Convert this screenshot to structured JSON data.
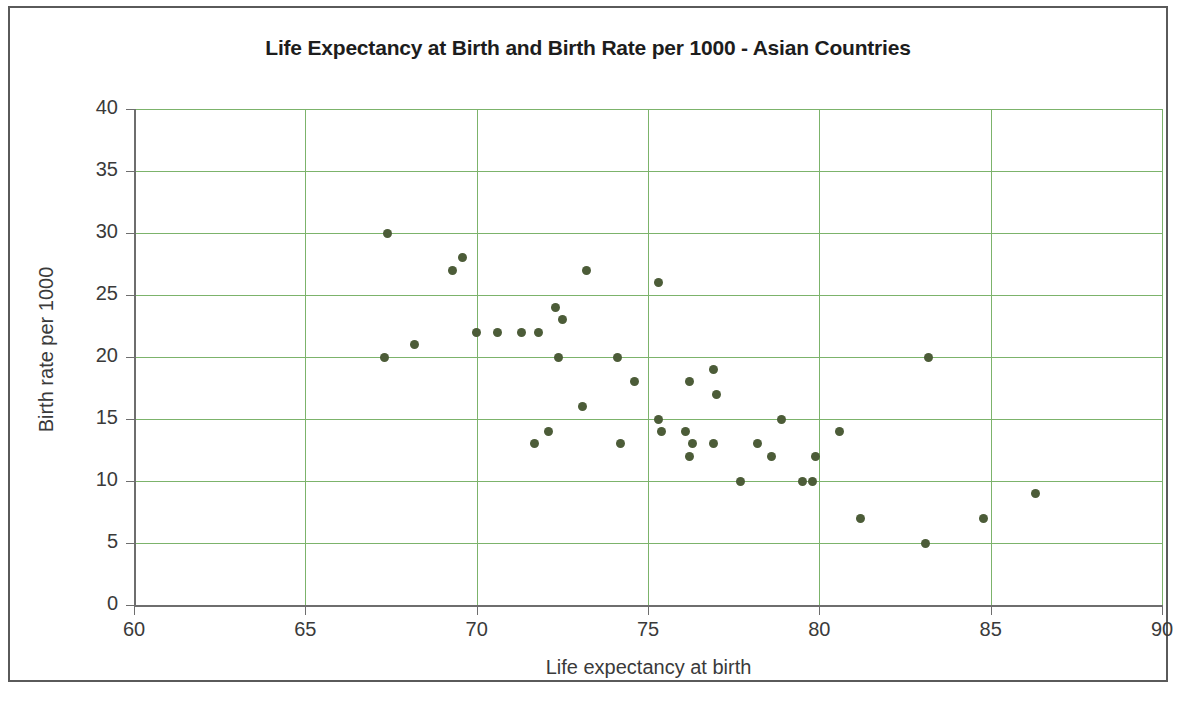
{
  "chart_data": {
    "type": "scatter",
    "title": "Life Expectancy at Birth and Birth Rate per 1000 - Asian Countries",
    "xlabel": "Life expectancy at birth",
    "ylabel": "Birth rate per 1000",
    "xlim": [
      60,
      90
    ],
    "ylim": [
      0,
      40
    ],
    "xticks": [
      60,
      65,
      70,
      75,
      80,
      85,
      90
    ],
    "yticks": [
      0,
      5,
      10,
      15,
      20,
      25,
      30,
      35,
      40
    ],
    "grid": true,
    "legend": null,
    "marker_color": "#4c5c38",
    "grid_color": "#7cb36b",
    "axis_color": "#6e6e6e",
    "points": [
      {
        "x": 67.4,
        "y": 30
      },
      {
        "x": 69.6,
        "y": 28
      },
      {
        "x": 69.3,
        "y": 27
      },
      {
        "x": 73.2,
        "y": 27
      },
      {
        "x": 75.3,
        "y": 26
      },
      {
        "x": 72.3,
        "y": 24
      },
      {
        "x": 72.5,
        "y": 23
      },
      {
        "x": 70.0,
        "y": 22
      },
      {
        "x": 70.6,
        "y": 22
      },
      {
        "x": 71.3,
        "y": 22
      },
      {
        "x": 71.8,
        "y": 22
      },
      {
        "x": 68.2,
        "y": 21
      },
      {
        "x": 67.3,
        "y": 20
      },
      {
        "x": 72.4,
        "y": 20
      },
      {
        "x": 74.1,
        "y": 20
      },
      {
        "x": 83.2,
        "y": 20
      },
      {
        "x": 76.9,
        "y": 19
      },
      {
        "x": 74.6,
        "y": 18
      },
      {
        "x": 76.2,
        "y": 18
      },
      {
        "x": 77.0,
        "y": 17
      },
      {
        "x": 73.1,
        "y": 16
      },
      {
        "x": 75.3,
        "y": 15
      },
      {
        "x": 78.9,
        "y": 15
      },
      {
        "x": 72.1,
        "y": 14
      },
      {
        "x": 75.4,
        "y": 14
      },
      {
        "x": 76.1,
        "y": 14
      },
      {
        "x": 80.6,
        "y": 14
      },
      {
        "x": 71.7,
        "y": 13
      },
      {
        "x": 74.2,
        "y": 13
      },
      {
        "x": 76.3,
        "y": 13
      },
      {
        "x": 76.9,
        "y": 13
      },
      {
        "x": 78.2,
        "y": 13
      },
      {
        "x": 76.2,
        "y": 12
      },
      {
        "x": 78.6,
        "y": 12
      },
      {
        "x": 79.9,
        "y": 12
      },
      {
        "x": 77.7,
        "y": 10
      },
      {
        "x": 79.5,
        "y": 10
      },
      {
        "x": 79.8,
        "y": 10
      },
      {
        "x": 86.3,
        "y": 9
      },
      {
        "x": 81.2,
        "y": 7
      },
      {
        "x": 84.8,
        "y": 7
      },
      {
        "x": 83.1,
        "y": 5
      }
    ]
  }
}
